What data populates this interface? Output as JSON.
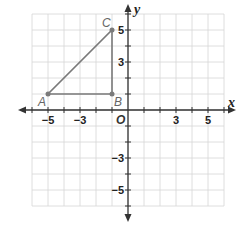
{
  "diagram": {
    "type": "coordinate-plane",
    "x_axis_label": "x",
    "y_axis_label": "y",
    "origin_label": "O",
    "range": {
      "xmin": -6,
      "xmax": 6,
      "ymin": -6,
      "ymax": 6
    },
    "x_tick_labels": [
      {
        "value": -5,
        "text": "−5"
      },
      {
        "value": -3,
        "text": "−3"
      },
      {
        "value": 3,
        "text": "3"
      },
      {
        "value": 5,
        "text": "5"
      }
    ],
    "y_tick_labels": [
      {
        "value": 5,
        "text": "5"
      },
      {
        "value": 3,
        "text": "3"
      },
      {
        "value": -3,
        "text": "−3"
      },
      {
        "value": -5,
        "text": "−5"
      }
    ],
    "points": [
      {
        "label": "A",
        "x": -5,
        "y": 1
      },
      {
        "label": "B",
        "x": -1,
        "y": 1
      },
      {
        "label": "C",
        "x": -1,
        "y": 5
      }
    ],
    "shape": "triangle ABC",
    "colors": {
      "grid": "#d6d6d6",
      "axis": "#333333",
      "triangle": "#7a7a7a"
    }
  }
}
